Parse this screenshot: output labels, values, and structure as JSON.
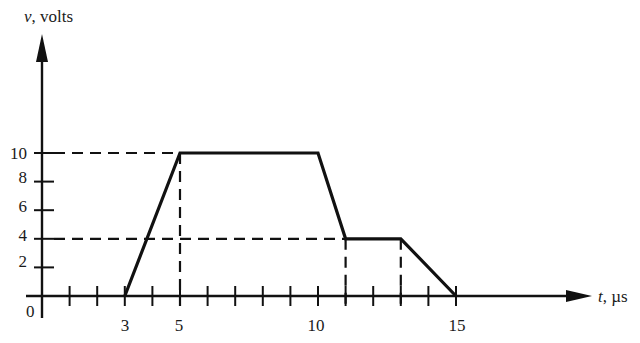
{
  "chart_data": {
    "type": "line",
    "title": "",
    "xlabel": "t, µs",
    "ylabel": "v, volts",
    "x_var": "t",
    "x_unit": "µs",
    "y_var": "v",
    "y_unit": "volts",
    "x": [
      3,
      5,
      10,
      11,
      13,
      15
    ],
    "series": [
      {
        "name": "v(t)",
        "values": [
          0,
          10,
          10,
          4,
          4,
          0
        ]
      }
    ],
    "xlim": [
      0,
      15
    ],
    "ylim": [
      0,
      10
    ],
    "x_tick_labels": [
      "0",
      "3",
      "5",
      "10",
      "15"
    ],
    "x_tick_positions": [
      1,
      2,
      3,
      4,
      5,
      6,
      7,
      8,
      9,
      10,
      11,
      12,
      13,
      14,
      15
    ],
    "y_tick_labels": [
      "2",
      "4",
      "6",
      "8",
      "10"
    ],
    "y_tick_positions": [
      2,
      4,
      6,
      8,
      10
    ],
    "origin_label": "0",
    "grid": false,
    "legend": "none",
    "annotations": [
      {
        "type": "dashed-hline",
        "y": 10,
        "from_x": 0,
        "to_x": 5
      },
      {
        "type": "dashed-hline",
        "y": 4,
        "from_x": 0,
        "to_x": 11
      },
      {
        "type": "dashed-vline",
        "x": 5,
        "from_y": 0,
        "to_y": 10
      },
      {
        "type": "dashed-vline",
        "x": 11,
        "from_y": 0,
        "to_y": 4
      },
      {
        "type": "dashed-vline",
        "x": 13,
        "from_y": 0,
        "to_y": 4
      }
    ]
  },
  "labels": {
    "y_var": "v",
    "y_unit": ", volts",
    "x_var": "t",
    "x_unit": ", µs",
    "origin": "0",
    "x_ticks": [
      "3",
      "5",
      "10",
      "15"
    ],
    "y_ticks": [
      "10",
      "8",
      "6",
      "4",
      "2"
    ]
  }
}
